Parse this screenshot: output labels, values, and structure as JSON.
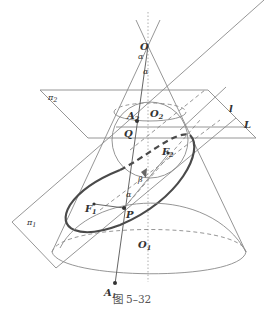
{
  "figure": {
    "caption": "图 5–32",
    "labels": {
      "O": "O",
      "alpha_top": "α",
      "alpha_mid": "α",
      "alpha_low": "α",
      "beta": "β",
      "pi2": "π",
      "pi2_sub": "2",
      "pi1": "π",
      "pi1_sub": "1",
      "A2": "A",
      "A2_sub": "2",
      "O2": "O",
      "O2_sub": "2",
      "Q": "Q",
      "F2": "F",
      "F2_sub": "2",
      "F1": "F",
      "F1_sub": "1",
      "P": "P",
      "O1": "O",
      "O1_sub": "1",
      "A1": "A",
      "A1_sub": "1",
      "l": "l",
      "L": "L"
    },
    "elements": [
      "cone with apex O",
      "inscribed sphere centered O2 tangent to cone along circle in plane π2",
      "cutting plane π1 producing ellipse with foci F1, F2",
      "point P on ellipse with generator line O–A2–P–A1",
      "base circle centered O1",
      "line l and L intersection of planes"
    ]
  }
}
